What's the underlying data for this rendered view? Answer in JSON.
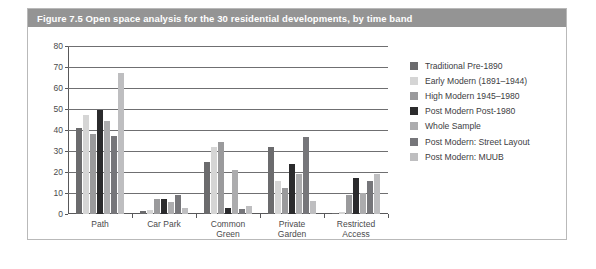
{
  "figure": {
    "title": "Figure 7.5  Open space analysis for the 30 residential developments, by time band",
    "title_bar_color": "#949494",
    "border_color": "#b9b9b9"
  },
  "chart_data": {
    "type": "bar",
    "title": "Open space analysis for the 30 residential developments, by time band",
    "xlabel": "",
    "ylabel": "",
    "ylim": [
      0,
      80
    ],
    "ytick_step": 10,
    "yticks": [
      0,
      10,
      20,
      30,
      40,
      50,
      60,
      70,
      80
    ],
    "ytick_labels": [
      "0",
      "10",
      "20",
      "30",
      "40",
      "50",
      "60",
      "70",
      "80"
    ],
    "grid": true,
    "legend_position": "right",
    "categories": [
      "Path",
      "Car Park",
      "Common\nGreen",
      "Private\nGarden",
      "Restricted\nAccess"
    ],
    "category_labels": [
      "Path",
      "Car Park",
      "Common Green",
      "Private Garden",
      "Restricted Access"
    ],
    "series": [
      {
        "name": "Traditional Pre-1890",
        "color": "#6b6b6d",
        "values": [
          41,
          1.5,
          25,
          32,
          0.5
        ]
      },
      {
        "name": "Early Modern (1891–1944)",
        "color": "#d5d5d5",
        "values": [
          47,
          2,
          32,
          15.5,
          1
        ]
      },
      {
        "name": "High Modern 1945–1980",
        "color": "#9a9a9c",
        "values": [
          38,
          7,
          34.5,
          12.5,
          9
        ]
      },
      {
        "name": "Post Modern Post-1980",
        "color": "#2b2b2d",
        "values": [
          49.5,
          7,
          3,
          24,
          17
        ]
      },
      {
        "name": "Whole Sample",
        "color": "#acacae",
        "values": [
          44.5,
          5.5,
          21,
          19,
          10
        ]
      },
      {
        "name": "Post Modern: Street Layout",
        "color": "#76767a",
        "values": [
          37,
          9,
          2.5,
          36.5,
          15.5
        ]
      },
      {
        "name": "Post Modern: MUUB",
        "color": "#bebec0",
        "values": [
          67,
          3,
          4,
          6,
          19
        ]
      }
    ]
  }
}
